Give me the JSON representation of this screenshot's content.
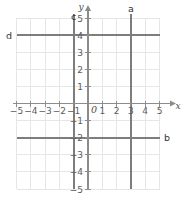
{
  "figure": {
    "type": "coordinate-grid",
    "background_color": "#ffffff",
    "grid_color": "#e3e3e3",
    "axis_color": "#8c8c8c",
    "line_color": "#7a7a7a",
    "label_color": "#5b5b5b"
  },
  "axes": {
    "x_name": "x",
    "y_name": "y",
    "origin_label": "0",
    "x_min": -5,
    "x_max": 5,
    "y_min": -5,
    "y_max": 5,
    "x_ticks": [
      {
        "value": -5,
        "label": "−5"
      },
      {
        "value": -4,
        "label": "−4"
      },
      {
        "value": -3,
        "label": "−3"
      },
      {
        "value": -2,
        "label": "−2"
      },
      {
        "value": -1,
        "label": "−1"
      },
      {
        "value": 1,
        "label": "1"
      },
      {
        "value": 2,
        "label": "2"
      },
      {
        "value": 3,
        "label": "3"
      },
      {
        "value": 4,
        "label": "4"
      },
      {
        "value": 5,
        "label": "5"
      }
    ],
    "y_ticks": [
      {
        "value": 5,
        "label": "5"
      },
      {
        "value": 4,
        "label": "4"
      },
      {
        "value": 3,
        "label": "3"
      },
      {
        "value": 2,
        "label": "2"
      },
      {
        "value": 1,
        "label": "1"
      },
      {
        "value": -1,
        "label": "−1"
      },
      {
        "value": -2,
        "label": "−2"
      },
      {
        "value": -3,
        "label": "−3"
      },
      {
        "value": -4,
        "label": "−4"
      },
      {
        "value": -5,
        "label": "−5"
      }
    ]
  },
  "lines": [
    {
      "id": "a",
      "label": "a",
      "orientation": "vertical",
      "value": 3,
      "equation": "x = 3"
    },
    {
      "id": "b",
      "label": "b",
      "orientation": "horizontal",
      "value": -2,
      "equation": "y = −2"
    },
    {
      "id": "c",
      "label": "c",
      "orientation": "vertical",
      "value": -1,
      "equation": "x = −1"
    },
    {
      "id": "d",
      "label": "d",
      "orientation": "horizontal",
      "value": 4,
      "equation": "y = 4"
    }
  ]
}
